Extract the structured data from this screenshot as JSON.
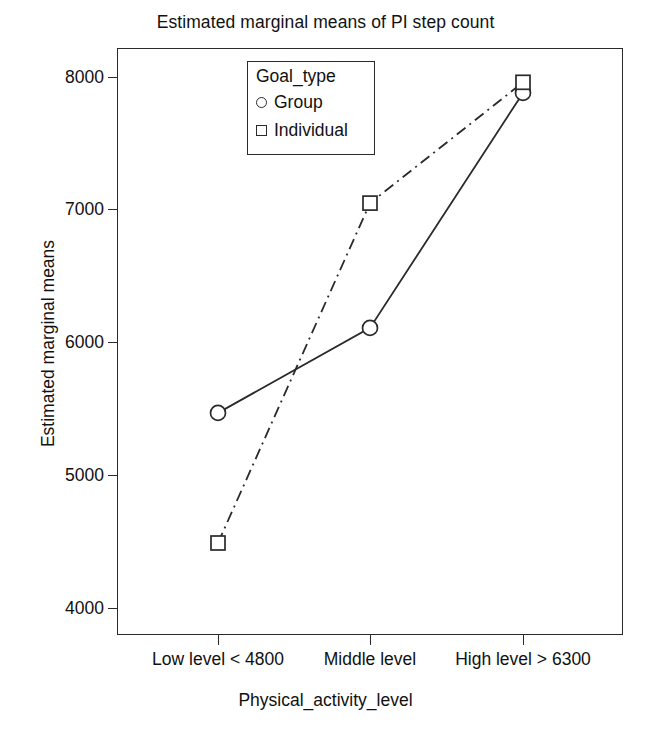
{
  "chart_data": {
    "type": "line",
    "title": "Estimated marginal means of PI step count",
    "xlabel": "Physical_activity_level",
    "ylabel": "Estimated marginal means",
    "categories": [
      "Low level < 4800",
      "Middle level",
      "High level > 6300"
    ],
    "ylim": [
      3600,
      8300
    ],
    "yticks": [
      4000,
      5000,
      6000,
      7000,
      8000
    ],
    "ytick_labels": [
      "4000",
      "5000",
      "6000",
      "7000",
      "8000"
    ],
    "grid": false,
    "legend": {
      "title": "Goal_type",
      "position": "inside-top-center",
      "entries": [
        {
          "label": "Group",
          "marker": "circle",
          "line": "solid"
        },
        {
          "label": "Individual",
          "marker": "square",
          "line": "dash-dot"
        }
      ]
    },
    "series": [
      {
        "name": "Group",
        "marker": "circle",
        "line_style": "solid",
        "values": [
          5470,
          6110,
          7880
        ]
      },
      {
        "name": "Individual",
        "marker": "square",
        "line_style": "dash-dot",
        "values": [
          4490,
          7050,
          7960
        ]
      }
    ],
    "colors": {
      "line": "#2a2a2a",
      "axis": "#2a2a2a",
      "background": "#ffffff",
      "text": "#111111"
    }
  }
}
